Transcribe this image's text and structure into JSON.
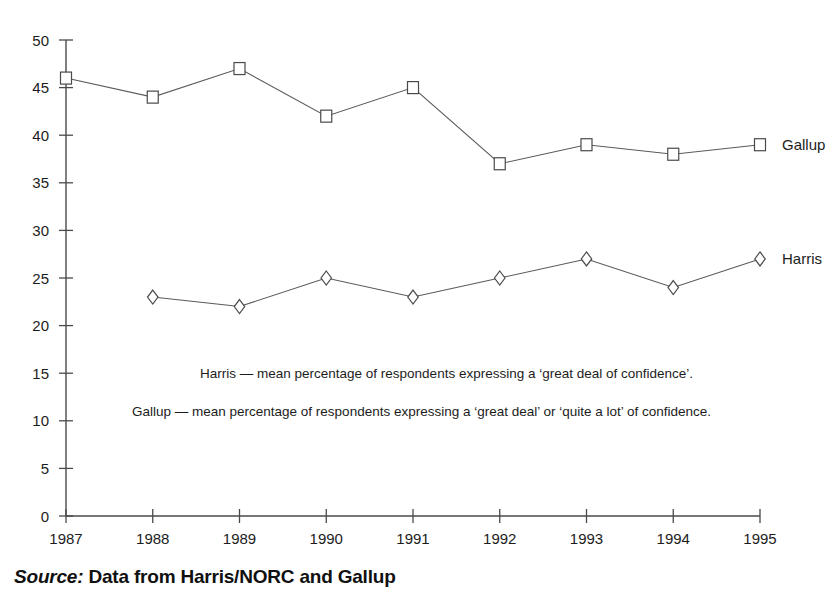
{
  "chart_data": {
    "type": "line",
    "title": "",
    "xlabel": "",
    "ylabel": "",
    "x": [
      1987,
      1988,
      1989,
      1990,
      1991,
      1992,
      1993,
      1994,
      1995
    ],
    "categories": [
      "1987",
      "1988",
      "1989",
      "1990",
      "1991",
      "1992",
      "1993",
      "1994",
      "1995"
    ],
    "xlim": [
      1987,
      1995
    ],
    "ylim": [
      0,
      50
    ],
    "yticks": [
      0,
      5,
      10,
      15,
      20,
      25,
      30,
      35,
      40,
      45,
      50
    ],
    "ytick_labels": [
      "0",
      "5",
      "10",
      "15",
      "20",
      "25",
      "30",
      "35",
      "40",
      "45",
      "50"
    ],
    "grid": false,
    "legend_position": "right-inline-labels",
    "series": [
      {
        "name": "Gallup",
        "marker": "square",
        "x": [
          1987,
          1988,
          1989,
          1990,
          1991,
          1992,
          1993,
          1994,
          1995
        ],
        "values": [
          46,
          44,
          47,
          42,
          45,
          37,
          39,
          38,
          39
        ]
      },
      {
        "name": "Harris",
        "marker": "diamond",
        "x": [
          1988,
          1989,
          1990,
          1991,
          1992,
          1993,
          1994,
          1995
        ],
        "values": [
          23,
          22,
          25,
          23,
          25,
          27,
          24,
          27
        ]
      }
    ],
    "annotations": [
      "Harris — mean percentage of respondents expressing a ‘great deal of confidence’.",
      "Gallup — mean percentage of respondents expressing a ‘great deal’ or ‘quite a lot’ of confidence."
    ],
    "series_labels": [
      "Gallup",
      "Harris"
    ],
    "colors": {
      "line": "#5a5a5a",
      "axis": "#4a4a4a",
      "text": "#1c1c1c",
      "marker_fill": "#ffffff",
      "background": "#ffffff"
    }
  },
  "source": {
    "keyword": "Source:",
    "text": "Data from Harris/NORC and Gallup"
  }
}
